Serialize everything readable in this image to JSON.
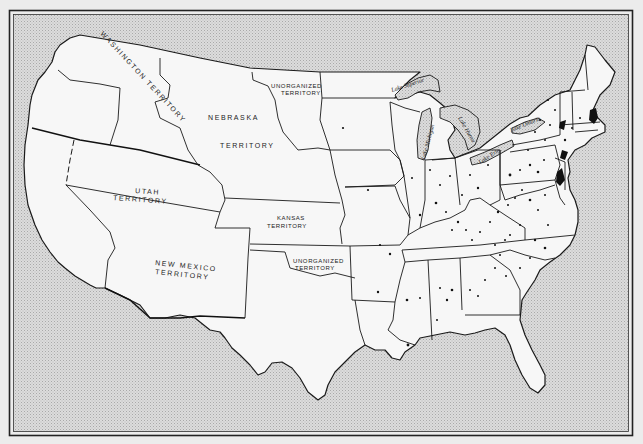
{
  "map": {
    "title": "",
    "colors": {
      "water": "#d4d4d4",
      "land": "#f7f7f7",
      "lines": "#1a1a1a",
      "frame": "#222222",
      "settlement_dots": "#111111"
    },
    "territory_labels": [
      {
        "id": "washington",
        "line1": "WASHINGTON TERRITORY"
      },
      {
        "id": "nebraska",
        "line1": "NEBRASKA",
        "line2": "TERRITORY"
      },
      {
        "id": "unorganized-north",
        "line1": "UNORGANIZED",
        "line2": "TERRITORY"
      },
      {
        "id": "utah",
        "line1": "UTAH",
        "line2": "TERRITORY"
      },
      {
        "id": "kansas",
        "line1": "KANSAS",
        "line2": "TERRITORY"
      },
      {
        "id": "new-mexico",
        "line1": "NEW MEXICO",
        "line2": "TERRITORY"
      },
      {
        "id": "unorganized-south",
        "line1": "UNORGANIZED",
        "line2": "TERRITORY"
      }
    ],
    "lake_labels": [
      {
        "id": "superior",
        "text": "Lake Superior"
      },
      {
        "id": "michigan",
        "text": "Lake Michigan"
      },
      {
        "id": "huron",
        "text": "Lake Huron"
      },
      {
        "id": "erie",
        "text": "Lake Erie"
      },
      {
        "id": "ontario",
        "text": "Lake Ontario"
      }
    ]
  }
}
